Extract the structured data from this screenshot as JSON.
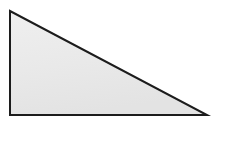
{
  "canvas": {
    "width": 225,
    "height": 158,
    "background_color": "#ffffff"
  },
  "figure": {
    "name": "right-triangle",
    "label": "Right triangle",
    "fill_color": "#e9e9e9",
    "fill_color_light": "#efefef",
    "fill_color_dark": "#e3e3e3",
    "stroke_color": "#1c1c1c",
    "stroke_width": 2,
    "points_string": "10,11 10,115 207,115",
    "vertices": [
      {
        "name": "top-left-vertex",
        "x": 10,
        "y": 11
      },
      {
        "name": "bottom-left-vertex",
        "x": 10,
        "y": 115
      },
      {
        "name": "bottom-right-vertex",
        "x": 207,
        "y": 115
      }
    ],
    "edges": [
      {
        "name": "left-leg",
        "from": "top-left-vertex",
        "to": "bottom-left-vertex",
        "length_px": 104
      },
      {
        "name": "bottom-leg",
        "from": "bottom-left-vertex",
        "to": "bottom-right-vertex",
        "length_px": 197
      },
      {
        "name": "hypotenuse",
        "from": "top-left-vertex",
        "to": "bottom-right-vertex",
        "length_px": 223
      }
    ],
    "right_angle_at": "bottom-left-vertex"
  }
}
